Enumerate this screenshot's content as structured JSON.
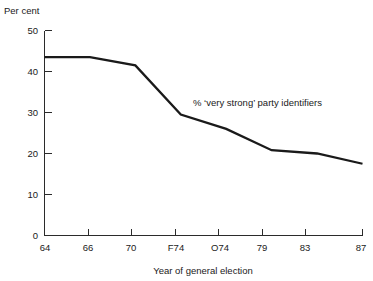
{
  "chart_data": {
    "type": "line",
    "title": "",
    "subtitle": "",
    "xlabel": "Year of general election",
    "ylabel": "Per cent",
    "categories": [
      "64",
      "66",
      "70",
      "F74",
      "O74",
      "79",
      "83",
      "87"
    ],
    "series": [
      {
        "name": "% 'very strong' party identifiers",
        "values": [
          43.5,
          43.5,
          41.5,
          29.5,
          26,
          20.8,
          20,
          17.5
        ]
      }
    ],
    "annotations": [
      {
        "text": "% ‘very strong’ party identifiers",
        "x_category": "F74",
        "y_value": 33
      }
    ],
    "xlim": [
      0,
      7
    ],
    "ylim": [
      0,
      50
    ],
    "y_ticks": [
      0,
      10,
      20,
      30,
      40,
      50
    ],
    "y_tick_labels": [
      "0",
      "10",
      "20",
      "30",
      "40",
      "50"
    ],
    "x_ticks": [
      "64",
      "66",
      "70",
      "F74",
      "O74",
      "79",
      "83",
      "87"
    ],
    "grid": false,
    "legend": "none",
    "tick_direction": "in",
    "spines": [
      "left",
      "bottom"
    ],
    "line_color": "#1a1a1a",
    "background_color": "#ffffff"
  },
  "axes": {
    "y_axis_caption": "Per cent",
    "x_axis_title": "Year of general election"
  },
  "annotation": {
    "series_label": "% ‘very strong’ party identifiers"
  },
  "y_ticks": [
    {
      "label": "50",
      "value": 50
    },
    {
      "label": "40",
      "value": 40
    },
    {
      "label": "30",
      "value": 30
    },
    {
      "label": "20",
      "value": 20
    },
    {
      "label": "10",
      "value": 10
    },
    {
      "label": "0",
      "value": 0
    }
  ],
  "x_ticks": [
    {
      "label": "64"
    },
    {
      "label": "66"
    },
    {
      "label": "70"
    },
    {
      "label": "F74"
    },
    {
      "label": "O74"
    },
    {
      "label": "79"
    },
    {
      "label": "83"
    },
    {
      "label": "87"
    }
  ]
}
